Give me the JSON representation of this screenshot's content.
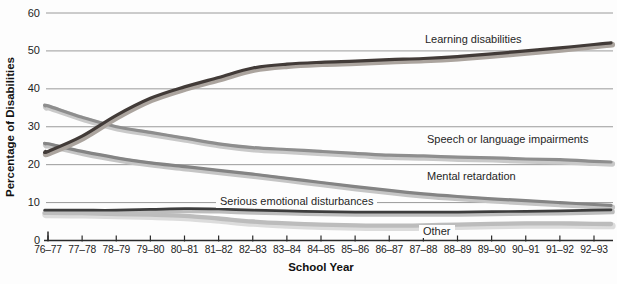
{
  "chart_data": {
    "type": "line",
    "title": "",
    "xlabel": "School Year",
    "ylabel": "Percentage of Disabilities",
    "x_categories": [
      "76–77",
      "77–78",
      "78–79",
      "79–80",
      "80–81",
      "81–82",
      "82–83",
      "83–84",
      "84–85",
      "85–86",
      "86–87",
      "87–88",
      "88–89",
      "89–90",
      "90–91",
      "91–92",
      "92–93"
    ],
    "ylim": [
      0,
      60
    ],
    "yticks": [
      0,
      10,
      20,
      30,
      40,
      50,
      60
    ],
    "grid": "horizontal",
    "legend": "inline-labels-on-chart",
    "colors": {
      "grid": "#9a9a9a",
      "axis": "#2a2a2a",
      "text": "#1e1e1e"
    },
    "series": [
      {
        "name": "Learning disabilities",
        "color": "#423b38",
        "halo": "#aba49e",
        "values": [
          23.5,
          27.5,
          33,
          37.5,
          40.5,
          43,
          45.5,
          46.5,
          47,
          47.3,
          47.7,
          48,
          48.5,
          49.2,
          50,
          50.8,
          51.7
        ]
      },
      {
        "name": "Speech or language impairments",
        "color": "#8e8e8e",
        "halo": "#c9c9c9",
        "values": [
          35.5,
          32.5,
          30,
          28.5,
          27,
          25.5,
          24.5,
          24,
          23.5,
          23,
          22.5,
          22.3,
          22,
          21.8,
          21.5,
          21.3,
          20.9
        ]
      },
      {
        "name": "Mental retardation",
        "color": "#848484",
        "halo": "#c5c5c5",
        "values": [
          25.5,
          23.5,
          21.8,
          20.5,
          19.5,
          18.5,
          17.5,
          16.4,
          15.3,
          14.2,
          13.2,
          12.3,
          11.6,
          11,
          10.5,
          10,
          9.5
        ]
      },
      {
        "name": "Serious emotional disturbances",
        "color": "#3d3d3d",
        "halo": "#bdbdbd",
        "values": [
          8,
          8,
          8,
          8.2,
          8.4,
          8.3,
          8,
          7.8,
          7.6,
          7.5,
          7.5,
          7.5,
          7.5,
          7.6,
          7.7,
          7.8,
          8
        ]
      },
      {
        "name": "Other",
        "color": "#bcbcbc",
        "halo": "#dcdcdc",
        "values": [
          7.3,
          7.2,
          7,
          6.8,
          6.5,
          5.8,
          5,
          4.5,
          4.2,
          4,
          3.9,
          4,
          4.2,
          4.4,
          4.5,
          4.5,
          4.4
        ]
      }
    ]
  }
}
